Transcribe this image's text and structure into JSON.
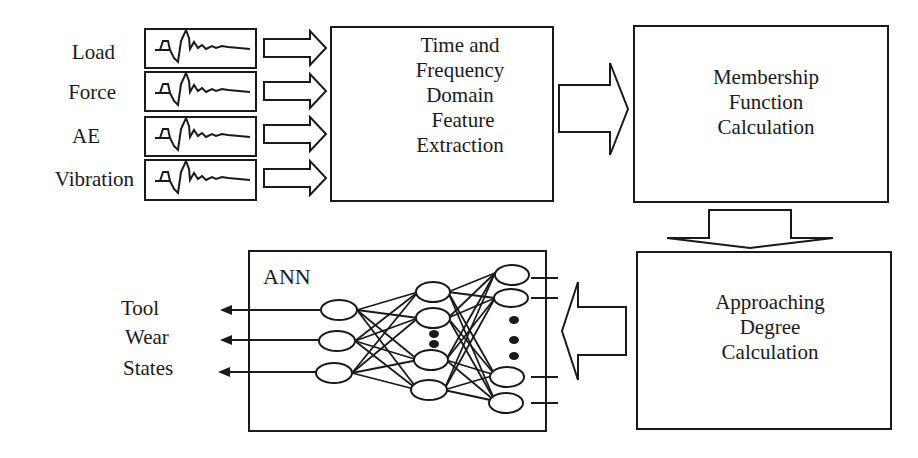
{
  "diagram": {
    "inputs": [
      {
        "label": "Load"
      },
      {
        "label": "Force"
      },
      {
        "label": "AE"
      },
      {
        "label": "Vibration"
      }
    ],
    "feature_box": {
      "lines": [
        "Time and",
        "Frequency",
        "Domain",
        "Feature",
        "Extraction"
      ]
    },
    "membership_box": {
      "lines": [
        "Membership",
        "Function",
        "Calculation"
      ]
    },
    "approaching_box": {
      "lines": [
        "Approaching",
        "Degree",
        "Calculation"
      ]
    },
    "ann_box": {
      "title": "ANN",
      "layers": {
        "input": 4,
        "hidden": 4,
        "output": 3
      }
    },
    "outputs": {
      "lines": [
        "Tool",
        "Wear",
        "States"
      ]
    },
    "colors": {
      "stroke": "#1a1a1a",
      "background": "#ffffff"
    }
  }
}
